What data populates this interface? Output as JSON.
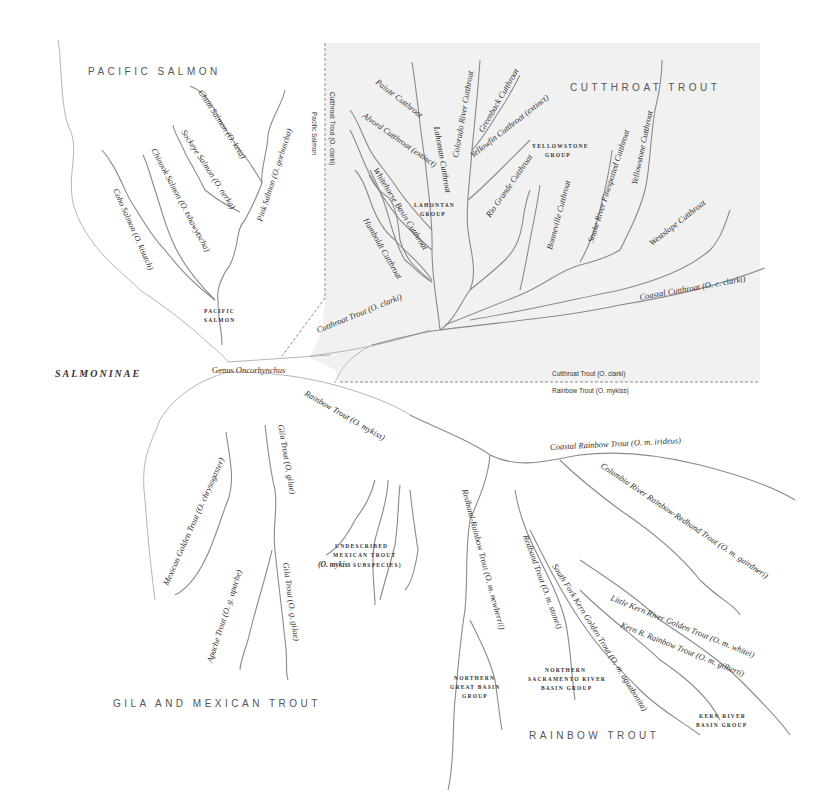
{
  "group_titles": {
    "pacific_salmon": "PACIFIC SALMON",
    "cutthroat_trout": "CUTTHROAT TROUT",
    "gila_mexican_trout": "GILA AND MEXICAN TROUT",
    "rainbow_trout": "RAINBOW TROUT",
    "subfamily": "SALMONINAE"
  },
  "root": {
    "genus_prefix": "Genus ",
    "genus_name": "Oncorhynchus"
  },
  "boundaries": {
    "pacific_side": "Pacific Salmon",
    "cutthroat_side_vertical": "Cutthroat Trout (O. clarki)",
    "cutthroat_side_horizontal": "Cutthroat Trout (O. clarki)",
    "rainbow_side_horizontal": "Rainbow Trout (O. mykiss)"
  },
  "pacific_salmon": {
    "group_label_1": "PACIFIC",
    "group_label_2": "SALMON",
    "species": [
      "Chum Salmon (O. keta)",
      "Sockeye Salmon (O. nerka)",
      "Chinook Salmon (O. tshawytscha)",
      "Coho Salmon (O. kisutch)",
      "Pink Salmon (O. gorbuscha)"
    ]
  },
  "cutthroat": {
    "trunk": "Cutthroat Trout (O. clarki)",
    "lahontan_group_1": "LAHONTAN",
    "lahontan_group_2": "GROUP",
    "yellowstone_group_1": "YELLOWSTONE",
    "yellowstone_group_2": "GROUP",
    "species": [
      "Paiute Cutthroat",
      "Alvord Cutthroat (extinct)",
      "Whitehorse Basin Cutthroat",
      "Humboldt Cutthroat",
      "Lahontan Cutthroat",
      "Colorado River Cutthroat",
      "Greenback Cutthroat",
      "Yellowfin Cutthroat (extinct)",
      "Rio Grande Cutthroat",
      "Bonneville Cutthroat",
      "Snake River Finespotted Cutthroat",
      "Yellowstone Cutthroat",
      "Westslope Cutthroat",
      "Coastal Cutthroat (O. c. clarki)"
    ]
  },
  "rainbow": {
    "trunk": "Rainbow Trout (O. mykiss)",
    "species": [
      "Coastal Rainbow Trout (O. m. irideus)",
      "Columbia River Rainbow-Redband Trout (O. m. gairdneri)",
      "Redband-Rainbow Trout (O. m. newberrii)",
      "Redband Trout (O. m. stonei)",
      "South Fork Kern Golden Trout (O. m. aguabonita)",
      "Little Kern River Golden Trout (O. m. whitei)",
      "Kern R. Rainbow Trout (O. m. gilberti)"
    ],
    "groups": {
      "northern_great_basin": [
        "NORTHERN",
        "GREAT BASIN",
        "GROUP"
      ],
      "northern_sacramento": [
        "NORTHERN",
        "SACRAMENTO RIVER",
        "BASIN GROUP"
      ],
      "kern_river": [
        "KERN RIVER",
        "BASIN GROUP"
      ]
    }
  },
  "gila_mexican": {
    "species": [
      "Mexican Golden Trout (O. chrysogaster)",
      "Gila Trout (O. gilae)",
      "Gila Trout (O. g. gilae)",
      "Apache Trout (O. g. apache)"
    ],
    "undescribed_1": "UNDESCRIBED",
    "undescribed_2": "MEXICAN TROUT",
    "undescribed_3_italic": "(O. mykiss",
    "undescribed_3_rest": " SUBSPECIES)"
  },
  "colors": {
    "cutthroat_region": "#f1f1f1",
    "branch": "#8a8a8a",
    "boundary": "#888888",
    "text": "#333333"
  }
}
